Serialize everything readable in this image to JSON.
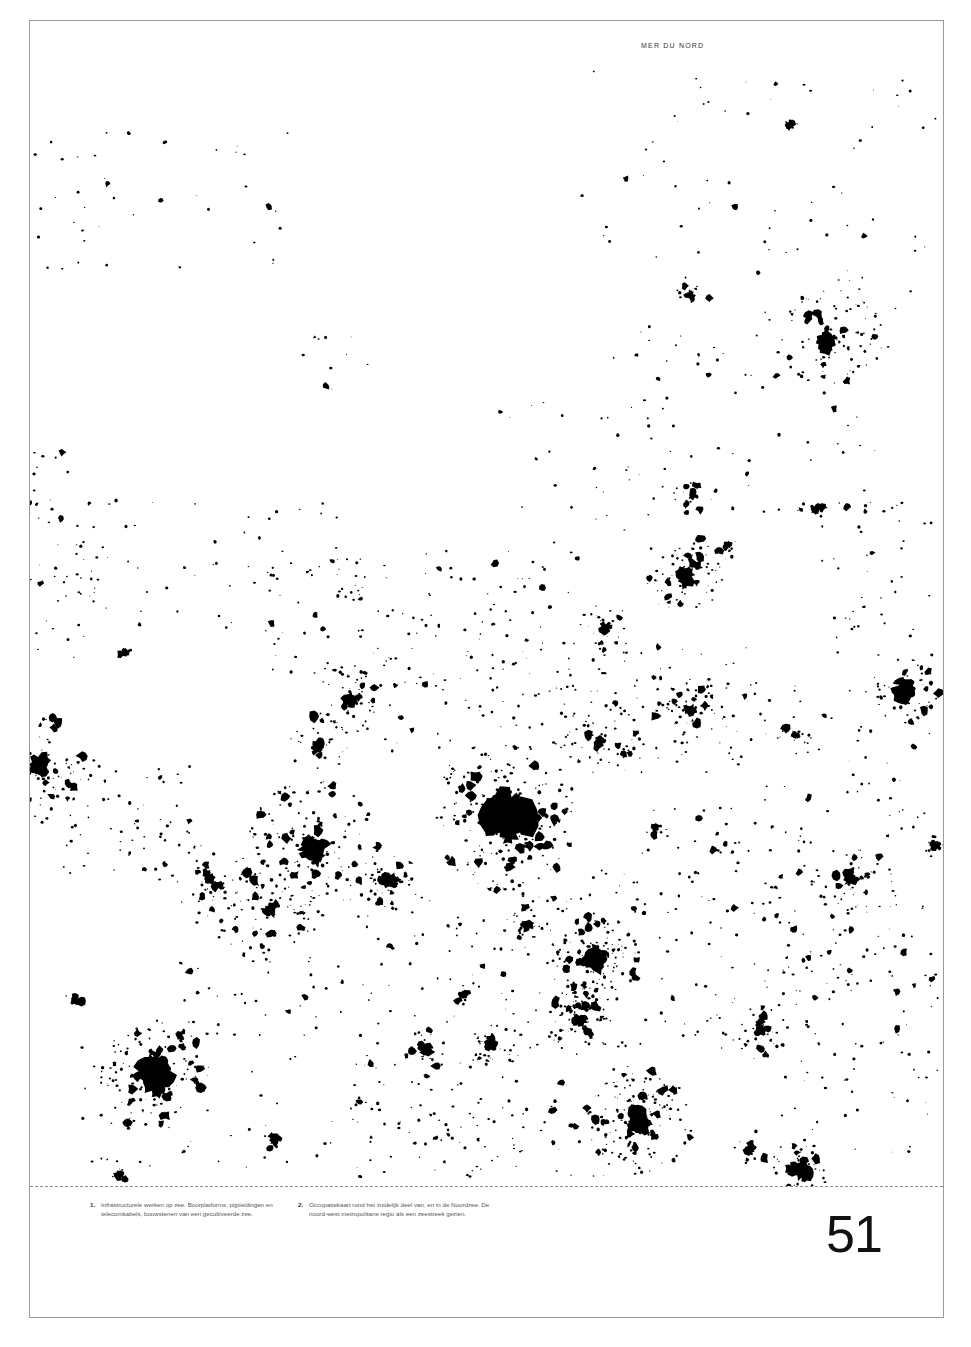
{
  "page": {
    "sea_label": "MER DU NORD",
    "page_number": "51"
  },
  "captions": [
    {
      "number": "1.",
      "text": "Infrastructurele werken op zee. Boorplatforms, pijpleidingen en telecomkabels, bouwstenen van een gecultiveerde zee."
    },
    {
      "number": "2.",
      "text": "Occupatiekaart rond het zuidelijk deel van, en in de Noordzee. De noord-west metropolitane regio als een zeestreek gezien."
    }
  ],
  "map": {
    "description": "Black-and-white occupation map: urbanised areas shown as black patches on white",
    "ink_color": "#000000",
    "paper_color": "#ffffff"
  }
}
